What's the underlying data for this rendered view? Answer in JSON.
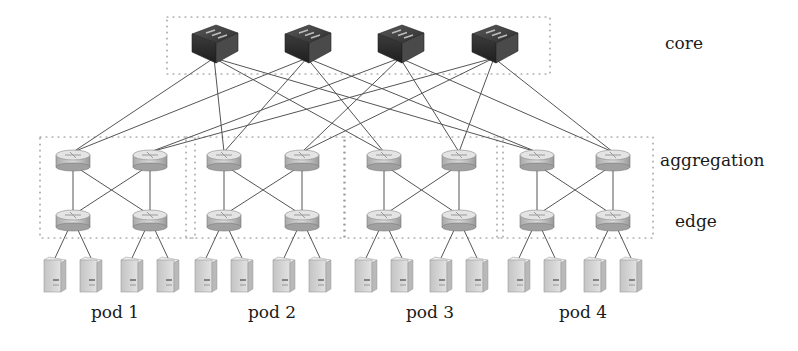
{
  "diagram": {
    "type": "fat-tree data center network topology",
    "tiers": {
      "core": "core",
      "aggregation": "aggregation",
      "edge": "edge"
    },
    "pods": [
      {
        "label": "pod 1",
        "agg_x": [
          73,
          150
        ],
        "label_x": 115
      },
      {
        "label": "pod 2",
        "agg_x": [
          224,
          302
        ],
        "label_x": 272
      },
      {
        "label": "pod 3",
        "agg_x": [
          384,
          459
        ],
        "label_x": 430
      },
      {
        "label": "pod 4",
        "agg_x": [
          537,
          613
        ],
        "label_x": 583
      }
    ],
    "core_switches_x": [
      214,
      307,
      400,
      494
    ],
    "colors": {
      "line": "#555555",
      "dotted_box": "#888888",
      "core_switch": "#3a3a3a",
      "router": "#c8c8c8",
      "server": "#d4d4d4"
    }
  }
}
